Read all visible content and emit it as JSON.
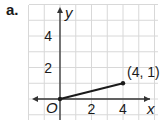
{
  "part_label": "a.",
  "chart_data": {
    "type": "line",
    "title": "",
    "xlabel": "x",
    "ylabel": "y",
    "origin_label": "O",
    "xlim": [
      -4,
      6
    ],
    "ylim": [
      -1,
      6
    ],
    "grid": true,
    "x_ticks": [
      2,
      4
    ],
    "y_ticks": [
      2,
      4
    ],
    "series": [
      {
        "name": "segment",
        "points": [
          [
            0,
            0
          ],
          [
            4,
            1
          ]
        ]
      }
    ],
    "annotations": [
      {
        "text": "(4, 1)",
        "x": 4,
        "y": 1
      }
    ],
    "colors": {
      "line": "#1a1a1a",
      "grid": "#d8d8d8",
      "axis": "#333333"
    }
  }
}
